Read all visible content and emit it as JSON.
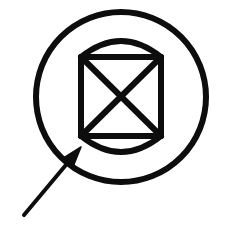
{
  "figure": {
    "title": "Circled cylinder symbol with X and annotation arrow",
    "background_color": "#ffffff",
    "stroke_color": "#0d0d0d",
    "canvas": {
      "width": 226,
      "height": 225
    },
    "elements": {
      "outer_circle": {
        "name": "outer-circle",
        "center_x": 121,
        "center_y": 97,
        "radius": 85,
        "stroke_width": 6,
        "fill": "none"
      },
      "cylinder": {
        "name": "cylinder-body",
        "left": 81,
        "right": 161,
        "top": 57,
        "bottom": 136,
        "top_arc_peak_y": 41,
        "bottom_arc_peak_y": 152,
        "stroke_width": 6,
        "fill": "none"
      },
      "cross": {
        "name": "x-cross",
        "line_1": {
          "x1": 81,
          "y1": 57,
          "x2": 161,
          "y2": 136
        },
        "line_2": {
          "x1": 161,
          "y1": 57,
          "x2": 81,
          "y2": 136
        },
        "stroke_width": 6,
        "center_x": 121,
        "center_y": 96
      },
      "arrow": {
        "name": "annotation-arrow",
        "tail_x": 24,
        "tail_y": 215,
        "tip_x": 81,
        "tip_y": 147,
        "stroke_width": 4,
        "head_length": 20,
        "head_width": 13,
        "direction": "points up and to the right"
      }
    }
  }
}
